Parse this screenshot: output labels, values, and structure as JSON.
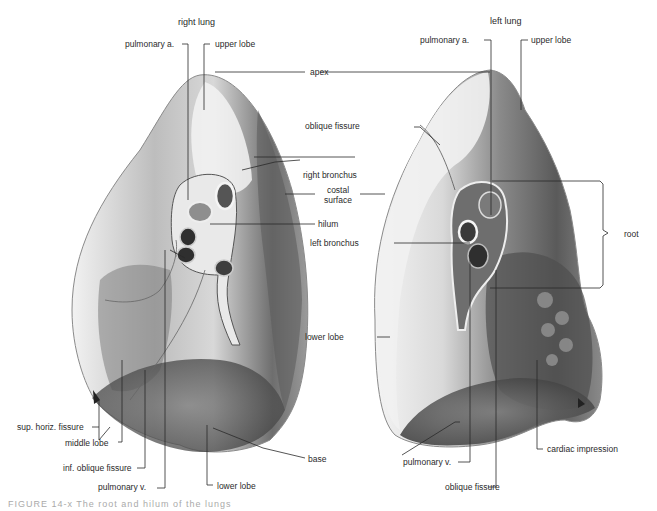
{
  "figure": {
    "title_right": "right lung",
    "title_left": "left lung",
    "caption": "FIGURE 14-x   The root and hilum of the lungs",
    "colors": {
      "background": "#ffffff",
      "leader_line": "#2a2a2a",
      "lung_light": "#e6e6e6",
      "lung_mid": "#a9a9a9",
      "lung_dark": "#5e5e5e",
      "vessel_dark": "#3a3a3a"
    }
  },
  "right_lung": {
    "labels": {
      "pulmonary_a": "pulmonary a.",
      "upper_lobe": "upper lobe",
      "right_bronchus": "right bronchus",
      "hilum": "hilum",
      "sup_horiz_fissure": "sup. horiz. fissure",
      "middle_lobe": "middle lobe",
      "inf_oblique_fissure": "inf. oblique fissure",
      "pulmonary_v": "pulmonary v.",
      "lower_lobe": "lower lobe"
    }
  },
  "shared": {
    "apex": "apex",
    "costal_surface_line1": "costal",
    "costal_surface_line2": "surface",
    "base": "base"
  },
  "left_lung": {
    "labels": {
      "pulmonary_a": "pulmonary a.",
      "upper_lobe": "upper lobe",
      "oblique_fissure_top": "oblique fissure",
      "left_bronchus": "left bronchus",
      "root": "root",
      "lower_lobe": "lower lobe",
      "pulmonary_v": "pulmonary v.",
      "cardiac_impression": "cardiac impression",
      "oblique_fissure_bottom": "oblique fissure"
    }
  }
}
